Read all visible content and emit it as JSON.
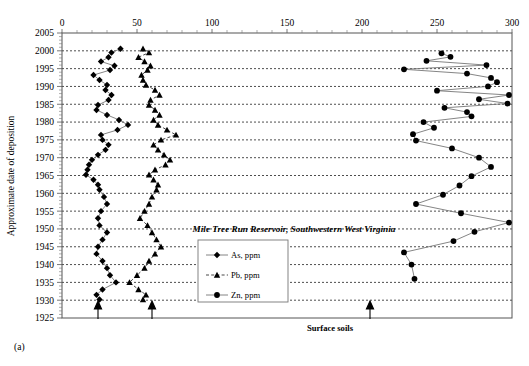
{
  "panel": {
    "label": "(a)"
  },
  "axes": {
    "x": {
      "title": "",
      "ticks": [
        0,
        50,
        100,
        150,
        200,
        250,
        300
      ],
      "min": 0,
      "max": 300,
      "position": "top"
    },
    "y": {
      "title": "Approximate date of deposition",
      "ticks": [
        2005,
        2000,
        1995,
        1990,
        1985,
        1980,
        1975,
        1970,
        1965,
        1960,
        1955,
        1950,
        1945,
        1940,
        1935,
        1930,
        1925
      ],
      "min": 1925,
      "max": 2005,
      "direction": "descending"
    }
  },
  "annotations": {
    "surface_soils": "Surface soils",
    "arrow_count": 3
  },
  "legend": {
    "entries": [
      {
        "label": "As, ppm",
        "marker": "diamond",
        "line": "solid",
        "color": "#000000"
      },
      {
        "label": "Pb, ppm",
        "marker": "triangle",
        "line": "dashed",
        "color": "#000000"
      },
      {
        "label": "Zn, ppm",
        "marker": "circle",
        "line": "solid",
        "color": "#000000"
      }
    ]
  },
  "chart_data": {
    "type": "line",
    "title": "Mile Tree Run Reservoir, Southwestern West Virginia",
    "xlabel": "",
    "ylabel": "Approximate date of deposition",
    "xlim": [
      0,
      300
    ],
    "ylim": [
      1925,
      2005
    ],
    "grid": true,
    "legend_position": "center",
    "orientation": "horizontal-value-vertical-year",
    "x_axis_position": "top",
    "y_axis_direction": "descending",
    "series": [
      {
        "name": "As, ppm",
        "marker": "diamond",
        "line": "solid",
        "points": [
          {
            "year": 2000.6,
            "value": 39
          },
          {
            "year": 1999.5,
            "value": 33
          },
          {
            "year": 1998.2,
            "value": 31
          },
          {
            "year": 1997.0,
            "value": 26
          },
          {
            "year": 1995.8,
            "value": 35
          },
          {
            "year": 1994.6,
            "value": 32
          },
          {
            "year": 1993.2,
            "value": 21
          },
          {
            "year": 1991.8,
            "value": 25
          },
          {
            "year": 1990.4,
            "value": 30
          },
          {
            "year": 1989.0,
            "value": 29
          },
          {
            "year": 1987.6,
            "value": 33
          },
          {
            "year": 1986.2,
            "value": 31
          },
          {
            "year": 1984.8,
            "value": 24
          },
          {
            "year": 1983.4,
            "value": 23
          },
          {
            "year": 1982.0,
            "value": 30
          },
          {
            "year": 1980.6,
            "value": 38
          },
          {
            "year": 1979.2,
            "value": 44
          },
          {
            "year": 1977.8,
            "value": 37
          },
          {
            "year": 1976.4,
            "value": 26
          },
          {
            "year": 1975.0,
            "value": 27
          },
          {
            "year": 1973.6,
            "value": 31
          },
          {
            "year": 1972.2,
            "value": 29
          },
          {
            "year": 1970.8,
            "value": 24
          },
          {
            "year": 1969.4,
            "value": 20
          },
          {
            "year": 1968.0,
            "value": 18
          },
          {
            "year": 1966.6,
            "value": 17
          },
          {
            "year": 1965.2,
            "value": 16
          },
          {
            "year": 1963.8,
            "value": 21
          },
          {
            "year": 1962.4,
            "value": 24
          },
          {
            "year": 1961.0,
            "value": 25
          },
          {
            "year": 1959.0,
            "value": 28
          },
          {
            "year": 1957.0,
            "value": 30
          },
          {
            "year": 1955.0,
            "value": 26
          },
          {
            "year": 1953.0,
            "value": 24
          },
          {
            "year": 1951.0,
            "value": 25
          },
          {
            "year": 1949.0,
            "value": 30
          },
          {
            "year": 1947.0,
            "value": 27
          },
          {
            "year": 1945.0,
            "value": 24
          },
          {
            "year": 1943.0,
            "value": 23
          },
          {
            "year": 1941.0,
            "value": 27
          },
          {
            "year": 1939.0,
            "value": 30
          },
          {
            "year": 1937.0,
            "value": 32
          },
          {
            "year": 1935.0,
            "value": 36
          },
          {
            "year": 1933.0,
            "value": 27
          },
          {
            "year": 1931.5,
            "value": 23
          },
          {
            "year": 1930.2,
            "value": 25
          }
        ]
      },
      {
        "name": "Pb, ppm",
        "marker": "triangle",
        "line": "dashed",
        "points": [
          {
            "year": 2000.6,
            "value": 54
          },
          {
            "year": 1999.5,
            "value": 58
          },
          {
            "year": 1998.2,
            "value": 51
          },
          {
            "year": 1997.0,
            "value": 55
          },
          {
            "year": 1995.8,
            "value": 59
          },
          {
            "year": 1994.6,
            "value": 57
          },
          {
            "year": 1993.2,
            "value": 53
          },
          {
            "year": 1991.8,
            "value": 54
          },
          {
            "year": 1990.4,
            "value": 56
          },
          {
            "year": 1989.0,
            "value": 62
          },
          {
            "year": 1987.6,
            "value": 65
          },
          {
            "year": 1986.2,
            "value": 59
          },
          {
            "year": 1984.8,
            "value": 58
          },
          {
            "year": 1983.4,
            "value": 62
          },
          {
            "year": 1982.0,
            "value": 65
          },
          {
            "year": 1980.6,
            "value": 61
          },
          {
            "year": 1979.2,
            "value": 64
          },
          {
            "year": 1977.8,
            "value": 70
          },
          {
            "year": 1976.4,
            "value": 76
          },
          {
            "year": 1975.0,
            "value": 66
          },
          {
            "year": 1973.6,
            "value": 61
          },
          {
            "year": 1972.2,
            "value": 64
          },
          {
            "year": 1970.8,
            "value": 68
          },
          {
            "year": 1969.4,
            "value": 72
          },
          {
            "year": 1968.0,
            "value": 69
          },
          {
            "year": 1966.6,
            "value": 62
          },
          {
            "year": 1965.2,
            "value": 58
          },
          {
            "year": 1963.8,
            "value": 61
          },
          {
            "year": 1962.4,
            "value": 64
          },
          {
            "year": 1961.0,
            "value": 63
          },
          {
            "year": 1959.0,
            "value": 60
          },
          {
            "year": 1957.0,
            "value": 58
          },
          {
            "year": 1955.0,
            "value": 55
          },
          {
            "year": 1953.0,
            "value": 52
          },
          {
            "year": 1951.0,
            "value": 57
          },
          {
            "year": 1949.0,
            "value": 60
          },
          {
            "year": 1947.0,
            "value": 63
          },
          {
            "year": 1945.0,
            "value": 66
          },
          {
            "year": 1943.0,
            "value": 62
          },
          {
            "year": 1941.0,
            "value": 58
          },
          {
            "year": 1939.0,
            "value": 55
          },
          {
            "year": 1937.0,
            "value": 50
          },
          {
            "year": 1935.0,
            "value": 45
          },
          {
            "year": 1933.0,
            "value": 51
          },
          {
            "year": 1931.5,
            "value": 56
          },
          {
            "year": 1930.2,
            "value": 54
          }
        ]
      },
      {
        "name": "Zn, ppm",
        "marker": "circle",
        "line": "solid",
        "points": [
          {
            "year": 1999.3,
            "value": 253
          },
          {
            "year": 1998.3,
            "value": 259
          },
          {
            "year": 1997.2,
            "value": 243
          },
          {
            "year": 1996.0,
            "value": 283
          },
          {
            "year": 1994.8,
            "value": 228
          },
          {
            "year": 1993.6,
            "value": 270
          },
          {
            "year": 1992.4,
            "value": 286
          },
          {
            "year": 1991.2,
            "value": 290
          },
          {
            "year": 1990.0,
            "value": 284
          },
          {
            "year": 1988.8,
            "value": 250
          },
          {
            "year": 1987.6,
            "value": 298
          },
          {
            "year": 1986.4,
            "value": 278
          },
          {
            "year": 1985.2,
            "value": 297
          },
          {
            "year": 1984.0,
            "value": 255
          },
          {
            "year": 1982.8,
            "value": 270
          },
          {
            "year": 1981.6,
            "value": 273
          },
          {
            "year": 1980.0,
            "value": 241
          },
          {
            "year": 1978.4,
            "value": 248
          },
          {
            "year": 1976.6,
            "value": 234
          },
          {
            "year": 1974.8,
            "value": 236
          },
          {
            "year": 1972.6,
            "value": 260
          },
          {
            "year": 1970.0,
            "value": 278
          },
          {
            "year": 1967.4,
            "value": 286
          },
          {
            "year": 1964.8,
            "value": 273
          },
          {
            "year": 1962.2,
            "value": 265
          },
          {
            "year": 1959.6,
            "value": 254
          },
          {
            "year": 1957.0,
            "value": 236
          },
          {
            "year": 1954.4,
            "value": 266
          },
          {
            "year": 1951.8,
            "value": 298
          },
          {
            "year": 1949.2,
            "value": 275
          },
          {
            "year": 1946.6,
            "value": 261
          },
          {
            "year": 1943.4,
            "value": 228
          },
          {
            "year": 1940.0,
            "value": 233
          },
          {
            "year": 1936.0,
            "value": 235
          }
        ]
      }
    ]
  }
}
